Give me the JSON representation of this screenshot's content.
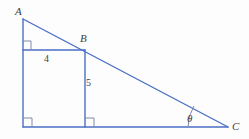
{
  "figure": {
    "type": "geometry-diagram",
    "width": 249,
    "height": 139,
    "background_color": "#fdfdfd",
    "stroke_color": "#4a6fc4",
    "text_color": "#3d3d3d"
  },
  "vertices": [
    {
      "name": "A",
      "label": "A",
      "x": 23,
      "y": 19,
      "label_x": 15,
      "label_y": 6
    },
    {
      "name": "B",
      "label": "B",
      "x": 85,
      "y": 50,
      "label_x": 80,
      "label_y": 33
    },
    {
      "name": "C",
      "label": "C",
      "x": 228,
      "y": 127,
      "label_x": 232,
      "label_y": 122
    }
  ],
  "measures": [
    {
      "name": "segment-4",
      "label": "4",
      "x": 44,
      "y": 54,
      "segment": "horizontal top of rectangle"
    },
    {
      "name": "segment-5",
      "label": "5",
      "x": 86,
      "y": 78,
      "segment": "vertical right of rectangle"
    }
  ],
  "angle": {
    "name": "theta",
    "label": "θ",
    "label_x": 187,
    "label_y": 113,
    "vertex_x": 228,
    "vertex_y": 127,
    "arc_radius": 40
  },
  "segments": [
    {
      "name": "hypotenuse-AC",
      "x1": 23,
      "y1": 19,
      "x2": 228,
      "y2": 127
    },
    {
      "name": "leg-A-to-base",
      "x1": 23,
      "y1": 19,
      "x2": 23,
      "y2": 127
    },
    {
      "name": "base-to-C",
      "x1": 23,
      "y1": 127,
      "x2": 228,
      "y2": 127
    },
    {
      "name": "rectangle-top",
      "x1": 23,
      "y1": 50,
      "x2": 85,
      "y2": 50
    },
    {
      "name": "rectangle-right",
      "x1": 85,
      "y1": 50,
      "x2": 85,
      "y2": 127
    }
  ],
  "right_angle_marks": [
    {
      "name": "right-angle-at-A-corner",
      "x": 23,
      "y": 50,
      "dir_x": 1,
      "dir_y": -1
    },
    {
      "name": "right-angle-bottom-left",
      "x": 23,
      "y": 127,
      "dir_x": 1,
      "dir_y": -1
    },
    {
      "name": "right-angle-at-B-foot",
      "x": 85,
      "y": 127,
      "dir_x": 1,
      "dir_y": -1
    }
  ]
}
